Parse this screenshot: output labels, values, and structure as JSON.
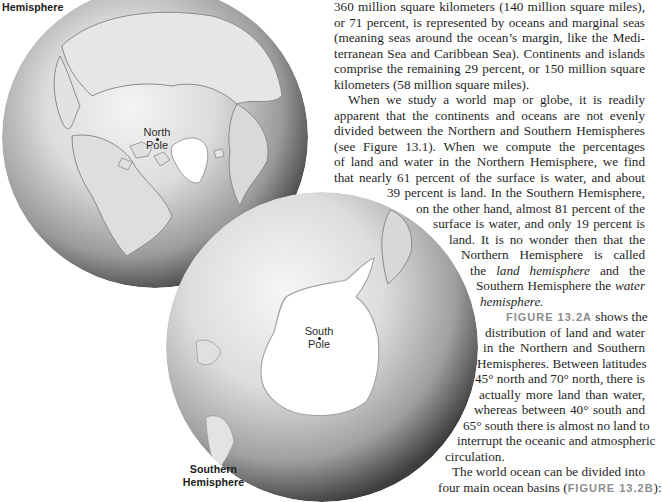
{
  "figure": {
    "north_label": "Northern Hemisphere",
    "north_label_visible": "Hemisphere",
    "south_label_line1": "Southern",
    "south_label_line2": "Hemisphere",
    "north_pole_line1": "North",
    "north_pole_line2": "Pole",
    "south_pole_line1": "South",
    "south_pole_line2": "Pole",
    "colors": {
      "ocean_light": "#f2f2f2",
      "ocean_mid": "#cfcfcf",
      "ocean_dark": "#5a5a5a",
      "ice": "#ffffff",
      "coast": "#8a8a8a"
    }
  },
  "body_text": {
    "lines": [
      "360 million square kilometers (140 million square miles),",
      "or 71 percent, is represented by oceans and marginal seas",
      "(meaning seas around the ocean’s margin, like the Medi-",
      "terranean Sea and Caribbean Sea). Continents and islands",
      "comprise the remaining 29 percent, or 150 million square",
      "kilometers (58 million square miles).",
      "When we study a world map or globe, it is readily",
      "apparent that the continents and oceans are not evenly",
      "divided between the Northern and Southern Hemispheres",
      "(see Figure 13.1). When we compute the percentages",
      "of land and water in the Northern Hemisphere, we find",
      "that nearly 61 percent of the surface is water, and about",
      "39 percent is land. In the Southern Hemisphere,",
      "on the other hand, almost 81 percent of the",
      "surface is water, and only 19 percent is",
      "land. It is no wonder then that the",
      "Northern Hemisphere is called",
      "the",
      "land hemisphere",
      "and the",
      "Southern Hemisphere the",
      "water",
      "hemisphere.",
      "FIGURE 13.2A",
      "shows the",
      "distribution of land and water",
      "in the Northern and Southern",
      "Hemispheres. Between latitudes",
      "45° north and 70° north, there is",
      "actually more land than water,",
      "whereas between 40° south and",
      "65° south there is almost no land to",
      "interrupt the oceanic and atmospheric",
      "circulation.",
      "The world ocean can be divided into",
      "four main ocean basins (",
      "FIGURE 13.2B",
      "):"
    ]
  }
}
